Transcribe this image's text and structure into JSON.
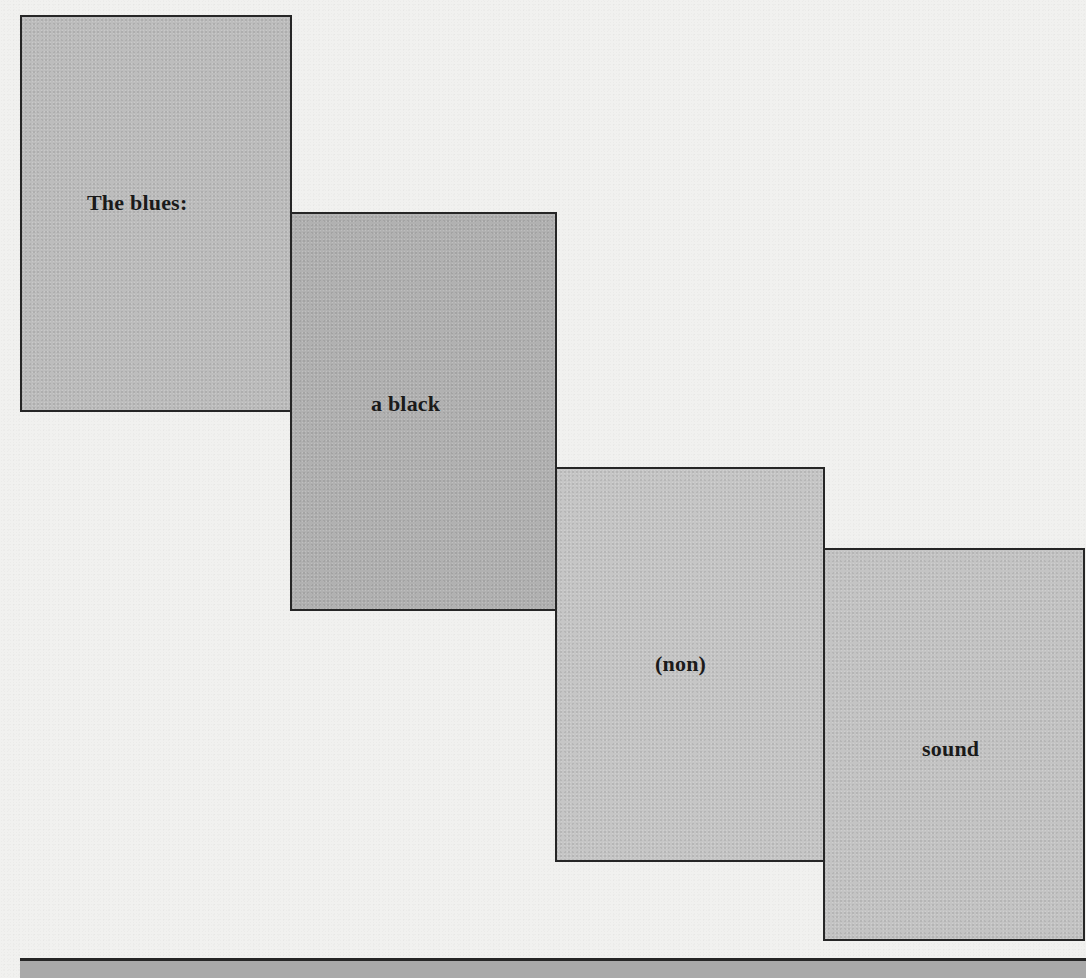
{
  "cards": [
    {
      "text": "The blues:",
      "fill": "#bdbdbd"
    },
    {
      "text": "a black",
      "fill": "#b1b1b1"
    },
    {
      "text": "(non)",
      "fill": "#c6c6c6"
    },
    {
      "text": "sound",
      "fill": "#c4c4c4"
    }
  ],
  "colors": {
    "background": "#f1f1ef",
    "border": "#262626",
    "text": "#1a1a1a",
    "bottom_strip": "#a9a9a9"
  }
}
